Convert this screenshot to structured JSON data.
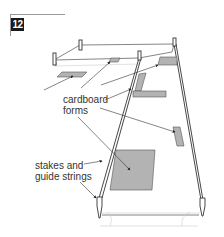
{
  "step": {
    "number": "12"
  },
  "labels": {
    "cardboard_forms_line1": "cardboard",
    "cardboard_forms_line2": "forms",
    "stakes_line1": "stakes and",
    "stakes_line2": "guide strings"
  },
  "colors": {
    "form_fill": "#b3b3b3",
    "line": "#444444",
    "string": "#888888",
    "badge": "#1a1a1a"
  }
}
